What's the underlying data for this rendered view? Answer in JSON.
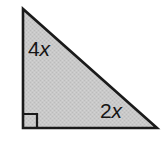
{
  "figure": {
    "name": "right-triangle-with-side-labels",
    "canvas": {
      "width": 163,
      "height": 144,
      "background": "#ffffff"
    },
    "shape": {
      "type": "right-triangle",
      "fill_color": "#c9c9c9",
      "stroke_color": "#1a1a1a",
      "stroke_width": 2.6,
      "texture": "dithered-halftone",
      "vertices": [
        {
          "name": "apex-top-left",
          "x": 23,
          "y": 9
        },
        {
          "name": "right-angle-bottom-left",
          "x": 23,
          "y": 128
        },
        {
          "name": "vertex-bottom-right",
          "x": 157,
          "y": 128
        }
      ]
    },
    "right_angle_marker": {
      "name": "right-angle-square",
      "at_vertex": "right-angle-bottom-left",
      "size": 14,
      "stroke_color": "#1a1a1a",
      "stroke_width": 2.2,
      "filled": false
    },
    "labels": {
      "vertical_leg": {
        "coefficient": "4",
        "variable": "x",
        "text": "4x",
        "side": "vertical-leg"
      },
      "horizontal_leg": {
        "coefficient": "2",
        "variable": "x",
        "text": "2x",
        "side": "horizontal-leg"
      }
    }
  }
}
